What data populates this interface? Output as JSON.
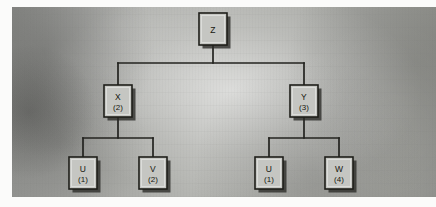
{
  "figure": {
    "kind": "node-link tree",
    "background_color": "#a5a6a2",
    "node_fill_color": "#c5c6c2",
    "node_border_color": "#1e1e1a",
    "edge_color": "#23231f",
    "panel": {
      "x": 12,
      "y": 7,
      "width": 424,
      "height": 190
    }
  },
  "tree": {
    "root": "Z",
    "nodes": [
      {
        "id": "Z",
        "label": "Z",
        "sub": "",
        "x": 213,
        "y": 29,
        "w": 28,
        "h": 32,
        "depth": 0,
        "parent": null
      },
      {
        "id": "X",
        "label": "X",
        "sub": "(2)",
        "x": 118,
        "y": 101,
        "w": 28,
        "h": 32,
        "depth": 1,
        "parent": "Z"
      },
      {
        "id": "Y",
        "label": "Y",
        "sub": "(3)",
        "x": 304,
        "y": 101,
        "w": 28,
        "h": 32,
        "depth": 1,
        "parent": "Z"
      },
      {
        "id": "U1",
        "label": "U",
        "sub": "(1)",
        "x": 83,
        "y": 173,
        "w": 28,
        "h": 32,
        "depth": 2,
        "parent": "X"
      },
      {
        "id": "V1",
        "label": "V",
        "sub": "(2)",
        "x": 153,
        "y": 173,
        "w": 28,
        "h": 32,
        "depth": 2,
        "parent": "X"
      },
      {
        "id": "U2",
        "label": "U",
        "sub": "(1)",
        "x": 269,
        "y": 173,
        "w": 28,
        "h": 32,
        "depth": 2,
        "parent": "Y"
      },
      {
        "id": "W1",
        "label": "W",
        "sub": "(4)",
        "x": 339,
        "y": 173,
        "w": 28,
        "h": 32,
        "depth": 2,
        "parent": "Y"
      }
    ],
    "edges": [
      {
        "from": "Z",
        "to": "X",
        "bus_y": 63
      },
      {
        "from": "Z",
        "to": "Y",
        "bus_y": 63
      },
      {
        "from": "X",
        "to": "U1",
        "bus_y": 138
      },
      {
        "from": "X",
        "to": "V1",
        "bus_y": 138
      },
      {
        "from": "Y",
        "to": "U2",
        "bus_y": 138
      },
      {
        "from": "Y",
        "to": "W1",
        "bus_y": 138
      }
    ]
  }
}
